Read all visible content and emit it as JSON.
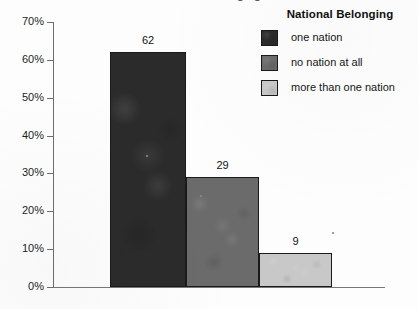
{
  "figure": {
    "cropped_title_fragment": "National Belonging",
    "background_color": "#fdfdfd"
  },
  "legend": {
    "title": "National Belonging",
    "position": "top-right",
    "entries": [
      {
        "label": "one nation",
        "color": "#2b2b2b",
        "swatch_name": "legend-swatch-one-nation"
      },
      {
        "label": "no nation at all",
        "color": "#6b6b6b",
        "swatch_name": "legend-swatch-no-nation-at-all"
      },
      {
        "label": "more than one nation",
        "color": "#c8c8c8",
        "swatch_name": "legend-swatch-more-than-one-nation"
      }
    ]
  },
  "y_axis": {
    "ticks": [
      "0%",
      "10%",
      "20%",
      "30%",
      "40%",
      "50%",
      "60%",
      "70%"
    ],
    "min_label": "0%",
    "max_label": "70%"
  },
  "bars": [
    {
      "label": "62",
      "category": "one nation",
      "value": 62,
      "color": "#2b2b2b"
    },
    {
      "label": "29",
      "category": "no nation at all",
      "value": 29,
      "color": "#6b6b6b"
    },
    {
      "label": "9",
      "category": "more than one nation",
      "value": 9,
      "color": "#c8c8c8"
    }
  ],
  "chart_data": {
    "type": "bar",
    "title": "National Belonging",
    "subtitle": "",
    "xlabel": "",
    "ylabel": "",
    "categories": [
      "one nation",
      "no nation at all",
      "more than one nation"
    ],
    "values": [
      62,
      29,
      9
    ],
    "data_labels": [
      "62",
      "29",
      "9"
    ],
    "series": [
      {
        "name": "National Belonging",
        "values": [
          62,
          29,
          9
        ]
      }
    ],
    "bar_colors": [
      "#2b2b2b",
      "#6b6b6b",
      "#c8c8c8"
    ],
    "ylim": [
      0,
      70
    ],
    "y_tick_values": [
      0,
      10,
      20,
      30,
      40,
      50,
      60,
      70
    ],
    "y_tick_labels": [
      "0%",
      "10%",
      "20%",
      "30%",
      "40%",
      "50%",
      "60%",
      "70%"
    ],
    "y_unit": "percent",
    "grid": false,
    "legend": {
      "visible": true,
      "position": "top-right",
      "title": "National Belonging",
      "entries": [
        "one nation",
        "no nation at all",
        "more than one nation"
      ]
    },
    "x_tick_labels": []
  }
}
